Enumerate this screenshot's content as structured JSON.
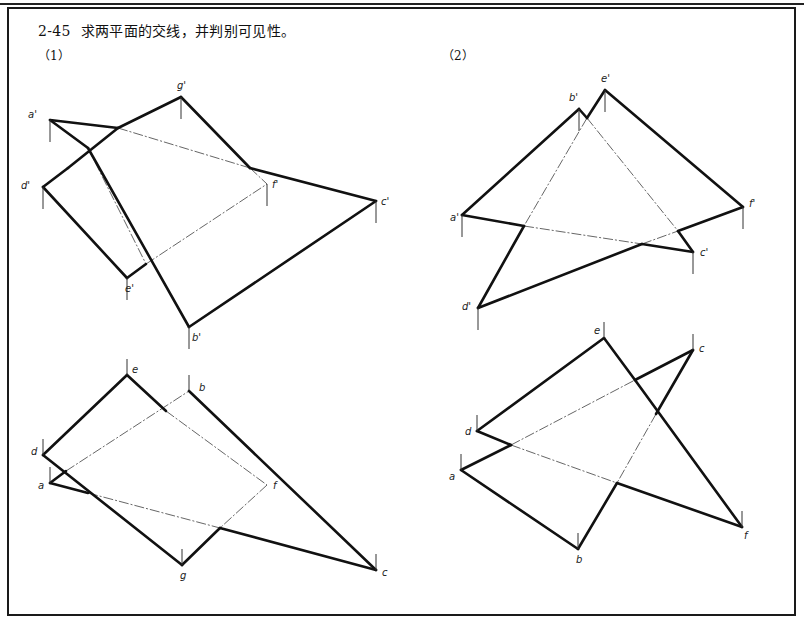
{
  "header": {
    "number": "2-45",
    "text": "求两平面的交线，并判别可见性。"
  },
  "subfigures": [
    {
      "label": "（1）",
      "pos": [
        38,
        46
      ],
      "views": [
        {
          "name": "front-view",
          "points": {
            "a'": [
              50,
              120
            ],
            "g'": [
              181,
              97
            ],
            "d'": [
              43,
              187
            ],
            "f'": [
              267,
              184
            ],
            "c'": [
              376,
              201
            ],
            "e'": [
              127,
              278
            ],
            "b'": [
              189,
              327
            ]
          },
          "labels": {
            "a'": [
              -22,
              -2
            ],
            "g'": [
              -4,
              -8
            ],
            "d'": [
              -22,
              2
            ],
            "f'": [
              5,
              4
            ],
            "c'": [
              5,
              4
            ],
            "e'": [
              -2,
              14
            ],
            "b'": [
              3,
              14
            ]
          },
          "ticks": [
            "a'",
            "g'",
            "d'",
            "f'",
            "c'",
            "e'",
            "b'"
          ],
          "visible": [
            [
              [
                50,
                120
              ],
              [
                88,
                148
              ]
            ],
            [
              [
                88,
                148
              ],
              [
                189,
                327
              ]
            ],
            [
              [
                50,
                120
              ],
              [
                118,
                128
              ]
            ],
            [
              [
                250,
                168
              ],
              [
                376,
                201
              ]
            ],
            [
              [
                189,
                327
              ],
              [
                376,
                201
              ]
            ],
            [
              [
                43,
                187
              ],
              [
                68,
                168
              ]
            ],
            [
              [
                68,
                168
              ],
              [
                118,
                128
              ]
            ],
            [
              [
                118,
                128
              ],
              [
                181,
                97
              ]
            ],
            [
              [
                181,
                97
              ],
              [
                250,
                168
              ]
            ],
            [
              [
                43,
                187
              ],
              [
                127,
                278
              ]
            ],
            [
              [
                127,
                278
              ],
              [
                146,
                264
              ]
            ]
          ],
          "hidden": [
            [
              [
                88,
                148
              ],
              [
                146,
                264
              ]
            ],
            [
              [
                118,
                128
              ],
              [
                250,
                168
              ]
            ],
            [
              [
                146,
                264
              ],
              [
                267,
                184
              ]
            ],
            [
              [
                250,
                168
              ],
              [
                267,
                184
              ]
            ]
          ]
        },
        {
          "name": "top-view",
          "points": {
            "e": [
              127,
              375
            ],
            "b": [
              189,
              391
            ],
            "d": [
              43,
              455
            ],
            "a": [
              50,
              483
            ],
            "f": [
              267,
              485
            ],
            "g": [
              182,
              565
            ],
            "c": [
              376,
              570
            ]
          },
          "labels": {
            "e": [
              5,
              -2
            ],
            "b": [
              10,
              0
            ],
            "d": [
              -12,
              0
            ],
            "a": [
              -12,
              6
            ],
            "f": [
              6,
              4
            ],
            "g": [
              -2,
              14
            ],
            "c": [
              6,
              6
            ]
          },
          "ticks": [
            "e",
            "b",
            "d",
            "a",
            "g",
            "c"
          ],
          "visible": [
            [
              [
                127,
                375
              ],
              [
                43,
                455
              ]
            ],
            [
              [
                127,
                375
              ],
              [
                166,
                411
              ]
            ],
            [
              [
                189,
                391
              ],
              [
                376,
                570
              ]
            ],
            [
              [
                376,
                570
              ],
              [
                220,
                528
              ]
            ],
            [
              [
                50,
                483
              ],
              [
                88,
                493
              ]
            ],
            [
              [
                50,
                483
              ],
              [
                66,
                471
              ]
            ],
            [
              [
                43,
                455
              ],
              [
                182,
                565
              ]
            ],
            [
              [
                182,
                565
              ],
              [
                220,
                528
              ]
            ]
          ],
          "hidden": [
            [
              [
                66,
                471
              ],
              [
                189,
                391
              ]
            ],
            [
              [
                166,
                411
              ],
              [
                267,
                485
              ]
            ],
            [
              [
                88,
                493
              ],
              [
                220,
                528
              ]
            ],
            [
              [
                267,
                485
              ],
              [
                220,
                528
              ]
            ]
          ]
        }
      ]
    },
    {
      "label": "（2）",
      "pos": [
        442,
        46
      ],
      "views": [
        {
          "name": "front-view",
          "points": {
            "e'": [
              605,
              90
            ],
            "b'": [
              579,
              109
            ],
            "a'": [
              462,
              215
            ],
            "f'": [
              743,
              207
            ],
            "c'": [
              693,
              252
            ],
            "d'": [
              478,
              308
            ]
          },
          "labels": {
            "e'": [
              -4,
              -8
            ],
            "b'": [
              -10,
              -8
            ],
            "a'": [
              -12,
              6
            ],
            "f'": [
              6,
              0
            ],
            "c'": [
              7,
              4
            ],
            "d'": [
              -16,
              2
            ]
          },
          "ticks": [
            "e'",
            "b'",
            "a'",
            "f'",
            "c'",
            "d'"
          ],
          "visible": [
            [
              [
                462,
                215
              ],
              [
                579,
                109
              ]
            ],
            [
              [
                579,
                109
              ],
              [
                587,
                118
              ]
            ],
            [
              [
                605,
                90
              ],
              [
                587,
                118
              ]
            ],
            [
              [
                605,
                90
              ],
              [
                743,
                207
              ]
            ],
            [
              [
                743,
                207
              ],
              [
                678,
                231
              ]
            ],
            [
              [
                462,
                215
              ],
              [
                524,
                226
              ]
            ],
            [
              [
                478,
                308
              ],
              [
                524,
                226
              ]
            ],
            [
              [
                478,
                308
              ],
              [
                642,
                244
              ]
            ],
            [
              [
                678,
                231
              ],
              [
                693,
                252
              ]
            ],
            [
              [
                693,
                252
              ],
              [
                642,
                244
              ]
            ]
          ],
          "hidden": [
            [
              [
                587,
                118
              ],
              [
                524,
                226
              ]
            ],
            [
              [
                587,
                118
              ],
              [
                678,
                231
              ]
            ],
            [
              [
                524,
                226
              ],
              [
                642,
                244
              ]
            ],
            [
              [
                642,
                244
              ],
              [
                678,
                231
              ]
            ]
          ]
        },
        {
          "name": "top-view",
          "points": {
            "e": [
              604,
              338
            ],
            "c": [
              693,
              350
            ],
            "d": [
              477,
              431
            ],
            "a": [
              461,
              470
            ],
            "b": [
              578,
              549
            ],
            "f": [
              742,
              527
            ]
          },
          "labels": {
            "e": [
              -10,
              -4
            ],
            "c": [
              6,
              2
            ],
            "d": [
              -12,
              4
            ],
            "a": [
              -12,
              10
            ],
            "b": [
              -2,
              14
            ],
            "f": [
              2,
              12
            ]
          },
          "ticks": [
            "e",
            "c",
            "d",
            "a",
            "b",
            "f"
          ],
          "visible": [
            [
              [
                604,
                338
              ],
              [
                477,
                431
              ]
            ],
            [
              [
                604,
                338
              ],
              [
                635,
                380
              ]
            ],
            [
              [
                635,
                380
              ],
              [
                742,
                527
              ]
            ],
            [
              [
                477,
                431
              ],
              [
                511,
                445
              ]
            ],
            [
              [
                461,
                470
              ],
              [
                511,
                445
              ]
            ],
            [
              [
                461,
                470
              ],
              [
                578,
                549
              ]
            ],
            [
              [
                578,
                549
              ],
              [
                617,
                483
              ]
            ],
            [
              [
                617,
                483
              ],
              [
                742,
                527
              ]
            ],
            [
              [
                693,
                350
              ],
              [
                635,
                380
              ]
            ],
            [
              [
                693,
                350
              ],
              [
                656,
                414
              ]
            ]
          ],
          "hidden": [
            [
              [
                511,
                445
              ],
              [
                635,
                380
              ]
            ],
            [
              [
                511,
                445
              ],
              [
                617,
                483
              ]
            ],
            [
              [
                656,
                414
              ],
              [
                617,
                483
              ]
            ]
          ]
        }
      ]
    }
  ]
}
